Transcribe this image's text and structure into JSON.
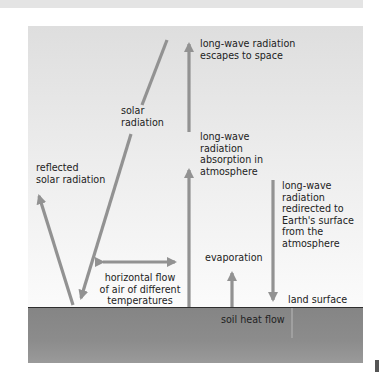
{
  "diagram": {
    "colors": {
      "arrow": "#929292",
      "sky_top": "#dedede",
      "sky_bottom": "#fbfbfb",
      "ground": "#8a8a8a",
      "ground_line": "#2e2e2e",
      "text": "#222222"
    },
    "labels": {
      "escapes_to_space": "long-wave radiation\nescapes to space",
      "solar_radiation": "solar\nradiation",
      "absorption": "long-wave\nradiation\nabsorption in\natmosphere",
      "reflected": "reflected\nsolar radiation",
      "redirected": "long-wave\nradiation\nredirected to\nEarth's surface\nfrom the\natmosphere",
      "evaporation": "evaporation",
      "horizontal_flow": "horizontal flow\nof air of different\ntemperatures",
      "land_surface": "land surface",
      "soil_heat_flow": "soil heat flow"
    }
  }
}
